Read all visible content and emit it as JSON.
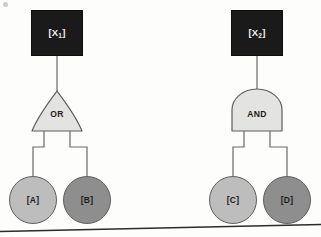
{
  "diagram": {
    "background_color": "#fdfdfc",
    "trees": [
      {
        "id": "tree-left",
        "top_event": {
          "name": "top-event-x1",
          "label": "[X",
          "subscript": "1",
          "suffix": "]",
          "full_label": "[X1]",
          "fill": "#1a1a1a",
          "text_color": "#f2f2f2"
        },
        "gate": {
          "name": "or-gate",
          "label": "OR",
          "shape": "pointed-arch",
          "fill": "#e3e3e1",
          "stroke": "#5e5e5e"
        },
        "inputs": [
          {
            "name": "basic-event-a",
            "label": "[A]",
            "fill": "#bdbdbd",
            "stroke": "#5e5e5e"
          },
          {
            "name": "basic-event-b",
            "label": "[B]",
            "fill": "#8e8e8e",
            "stroke": "#5e5e5e"
          }
        ]
      },
      {
        "id": "tree-right",
        "top_event": {
          "name": "top-event-x2",
          "label": "[X",
          "subscript": "2",
          "suffix": "]",
          "full_label": "[X2]",
          "fill": "#1a1a1a",
          "text_color": "#f2f2f2"
        },
        "gate": {
          "name": "and-gate",
          "label": "AND",
          "shape": "dome",
          "fill": "#e3e3e1",
          "stroke": "#5e5e5e"
        },
        "inputs": [
          {
            "name": "basic-event-c",
            "label": "[C]",
            "fill": "#bdbdbd",
            "stroke": "#5e5e5e"
          },
          {
            "name": "basic-event-d",
            "label": "[D]",
            "fill": "#8e8e8e",
            "stroke": "#5e5e5e"
          }
        ]
      }
    ],
    "connector_color": "#6b6b6b",
    "footer_rule": {
      "name": "page-edge-rule",
      "color": "#2b2b2b"
    }
  }
}
